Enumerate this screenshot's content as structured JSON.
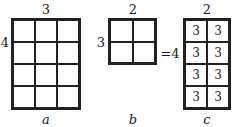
{
  "figure_a": {
    "top_label": "3",
    "side_label": "4",
    "caption": "a",
    "rows": 4,
    "cols": 3
  },
  "figure_b": {
    "top_label": "2",
    "side_label": "3",
    "caption": "b",
    "rows": 2,
    "cols": 2
  },
  "equals_label": "=4",
  "figure_c": {
    "top_label": "2",
    "caption": "c",
    "rows": 4,
    "cols": 2,
    "cells": [
      "3",
      "3",
      "3",
      "3",
      "3",
      "3",
      "3",
      "3"
    ]
  }
}
